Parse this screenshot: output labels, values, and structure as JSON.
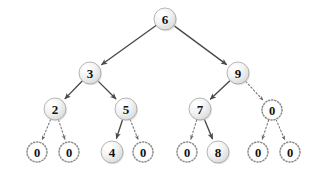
{
  "figure": {
    "background_color": "#ffffff",
    "node_fill_color": "#ececec",
    "node_highlight_color": "#fdfdfd",
    "node_stroke_color": "#9a9a9a",
    "edge_color": "#4a4a4a",
    "label_color": "#111111",
    "node_radius": 11,
    "null_node_radius": 10
  },
  "nodes": [
    {
      "id": "n6",
      "label": "6",
      "x": 165,
      "y": 19,
      "style": "solid",
      "level": 0
    },
    {
      "id": "n3",
      "label": "3",
      "x": 90,
      "y": 73,
      "style": "solid",
      "level": 1
    },
    {
      "id": "n9",
      "label": "9",
      "x": 238,
      "y": 73,
      "style": "solid",
      "level": 1
    },
    {
      "id": "n2",
      "label": "2",
      "x": 55,
      "y": 109,
      "style": "solid",
      "level": 2
    },
    {
      "id": "n5",
      "label": "5",
      "x": 126,
      "y": 109,
      "style": "solid",
      "level": 2
    },
    {
      "id": "n7",
      "label": "7",
      "x": 200,
      "y": 109,
      "style": "solid",
      "level": 2
    },
    {
      "id": "z9r",
      "label": "0",
      "x": 272,
      "y": 110,
      "style": "dotted",
      "level": 2
    },
    {
      "id": "z2l",
      "label": "0",
      "x": 37,
      "y": 152,
      "style": "dotted",
      "level": 3
    },
    {
      "id": "z2r",
      "label": "0",
      "x": 69,
      "y": 152,
      "style": "dotted",
      "level": 3
    },
    {
      "id": "n4",
      "label": "4",
      "x": 112,
      "y": 152,
      "style": "solid",
      "level": 3
    },
    {
      "id": "z5r",
      "label": "0",
      "x": 143,
      "y": 152,
      "style": "dotted",
      "level": 3
    },
    {
      "id": "z7l",
      "label": "0",
      "x": 187,
      "y": 152,
      "style": "dotted",
      "level": 3
    },
    {
      "id": "n8",
      "label": "8",
      "x": 218,
      "y": 152,
      "style": "solid",
      "level": 3
    },
    {
      "id": "z0l",
      "label": "0",
      "x": 258,
      "y": 152,
      "style": "dotted",
      "level": 3
    },
    {
      "id": "z0r",
      "label": "0",
      "x": 290,
      "y": 152,
      "style": "dotted",
      "level": 3
    }
  ],
  "edges": [
    {
      "from": "n6",
      "to": "n3",
      "style": "solid",
      "arrow": true
    },
    {
      "from": "n6",
      "to": "n9",
      "style": "solid",
      "arrow": true
    },
    {
      "from": "n3",
      "to": "n2",
      "style": "solid",
      "arrow": true
    },
    {
      "from": "n3",
      "to": "n5",
      "style": "solid",
      "arrow": true
    },
    {
      "from": "n9",
      "to": "n7",
      "style": "solid",
      "arrow": true
    },
    {
      "from": "n9",
      "to": "z9r",
      "style": "dashed",
      "arrow": true
    },
    {
      "from": "n2",
      "to": "z2l",
      "style": "dashed",
      "arrow": true
    },
    {
      "from": "n2",
      "to": "z2r",
      "style": "dashed",
      "arrow": true
    },
    {
      "from": "n5",
      "to": "n4",
      "style": "solid",
      "arrow": true
    },
    {
      "from": "n5",
      "to": "z5r",
      "style": "dashed",
      "arrow": true
    },
    {
      "from": "n7",
      "to": "z7l",
      "style": "dashed",
      "arrow": true
    },
    {
      "from": "n7",
      "to": "n8",
      "style": "solid",
      "arrow": true
    },
    {
      "from": "z9r",
      "to": "z0l",
      "style": "dashed",
      "arrow": true
    },
    {
      "from": "z9r",
      "to": "z0r",
      "style": "dashed",
      "arrow": true
    }
  ]
}
